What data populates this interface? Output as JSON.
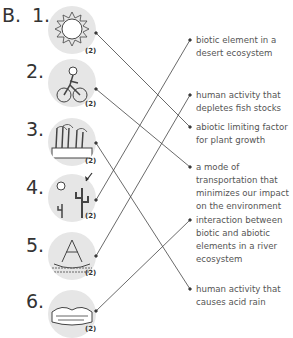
{
  "section": "B.",
  "items": [
    {
      "number": "1.",
      "icon": "sun-icon",
      "marks": "(2)"
    },
    {
      "number": "2.",
      "icon": "cyclist-icon",
      "marks": "(2)"
    },
    {
      "number": "3.",
      "icon": "factory-smoke-icon",
      "marks": "(2)"
    },
    {
      "number": "4.",
      "icon": "desert-cactus-icon",
      "marks": "(2)"
    },
    {
      "number": "5.",
      "icon": "fishing-boat-net-icon",
      "marks": "(2)"
    },
    {
      "number": "6.",
      "icon": "river-rocks-icon",
      "marks": "(2)"
    }
  ],
  "descriptions": [
    {
      "text": "biotic element in a desert ecosystem"
    },
    {
      "text": "human activity that depletes fish stocks"
    },
    {
      "text": "abiotic limiting factor for plant growth"
    },
    {
      "text": "a mode of transportation that minimizes our impact on the environment"
    },
    {
      "text": "interaction between biotic and abiotic elements in a river ecosystem"
    },
    {
      "text": "human activity that causes acid rain"
    }
  ],
  "matches": [
    {
      "item": "1.",
      "description": "abiotic limiting factor for plant growth"
    },
    {
      "item": "2.",
      "description": "a mode of transportation that minimizes our impact on the environment"
    },
    {
      "item": "3.",
      "description": "human activity that causes acid rain"
    },
    {
      "item": "4.",
      "description": "biotic element in a desert ecosystem"
    },
    {
      "item": "5.",
      "description": "human activity that depletes fish stocks"
    },
    {
      "item": "6.",
      "description": "interaction between biotic and abiotic elements in a river ecosystem"
    }
  ]
}
